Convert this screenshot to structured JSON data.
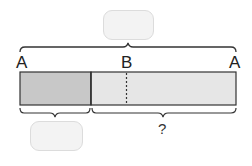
{
  "diagram": {
    "type": "bar-model",
    "top_answer_box": {
      "value": ""
    },
    "bottom_answer_box": {
      "value": ""
    },
    "points": [
      {
        "label": "A",
        "position": "left-end"
      },
      {
        "label": "B",
        "position": "middle"
      },
      {
        "label": "A",
        "position": "right-end"
      }
    ],
    "unknown_label": "?",
    "colors": {
      "shaded_segment": "#c8c8c8",
      "light_segment": "#e6e6e6",
      "outline": "#333333",
      "answer_box_fill": "#f3f3f3",
      "answer_box_border": "#dcdcdc"
    }
  }
}
